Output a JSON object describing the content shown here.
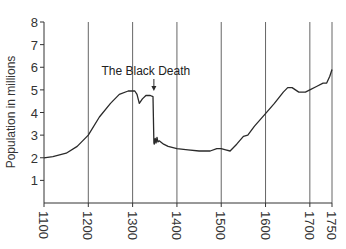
{
  "chart_data": {
    "type": "line",
    "title": "",
    "xlabel": "",
    "ylabel": "Population in millions",
    "xlim": [
      1100,
      1750
    ],
    "ylim": [
      0,
      8
    ],
    "x_ticks": [
      1100,
      1200,
      1300,
      1400,
      1500,
      1600,
      1700,
      1750
    ],
    "x_tick_labels": [
      "1100",
      "1200",
      "1300",
      "1400",
      "1500",
      "1600",
      "1700",
      "1750"
    ],
    "y_ticks": [
      1,
      2,
      3,
      4,
      5,
      6,
      7,
      8
    ],
    "y_tick_labels": [
      "1",
      "2",
      "3",
      "4",
      "5",
      "6",
      "7",
      "8"
    ],
    "grid": {
      "vertical": true,
      "horizontal": false,
      "vertical_at": [
        1200,
        1300,
        1400,
        1500,
        1600,
        1700,
        1750
      ]
    },
    "legend": null,
    "series": [
      {
        "name": "Population",
        "x": [
          1100,
          1120,
          1150,
          1175,
          1200,
          1225,
          1250,
          1270,
          1290,
          1305,
          1310,
          1315,
          1322,
          1330,
          1340,
          1346,
          1348,
          1349,
          1351,
          1353,
          1355,
          1357,
          1360,
          1370,
          1380,
          1400,
          1425,
          1450,
          1475,
          1490,
          1500,
          1510,
          1520,
          1535,
          1550,
          1560,
          1575,
          1600,
          1620,
          1640,
          1650,
          1660,
          1675,
          1690,
          1700,
          1715,
          1730,
          1738,
          1745,
          1750
        ],
        "values": [
          2.0,
          2.05,
          2.2,
          2.5,
          3.0,
          3.8,
          4.4,
          4.8,
          4.95,
          4.95,
          4.8,
          4.4,
          4.6,
          4.75,
          4.75,
          4.7,
          2.65,
          2.6,
          2.85,
          2.65,
          2.9,
          2.7,
          2.75,
          2.6,
          2.5,
          2.4,
          2.35,
          2.3,
          2.3,
          2.4,
          2.4,
          2.35,
          2.3,
          2.6,
          2.95,
          3.0,
          3.4,
          3.95,
          4.4,
          4.9,
          5.1,
          5.1,
          4.9,
          4.9,
          5.0,
          5.15,
          5.3,
          5.3,
          5.6,
          5.9
        ]
      }
    ],
    "annotations": [
      {
        "text": "The Black Death",
        "x": 1348,
        "y": 5.0,
        "arrow": true
      }
    ]
  }
}
